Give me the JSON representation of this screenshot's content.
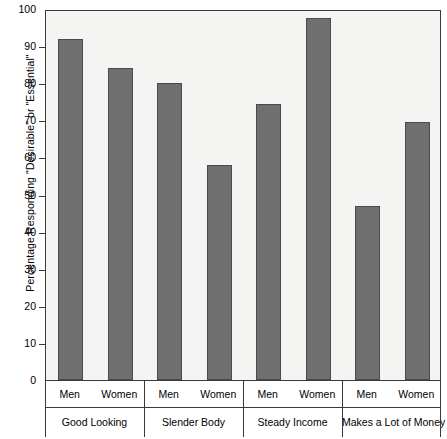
{
  "chart_data": {
    "type": "bar",
    "title": "",
    "subtitle": "",
    "xlabel": "",
    "ylabel": "Percentage Responding \"Desirable\" or \"Essential\"",
    "ylim": [
      0,
      100
    ],
    "ytick_step": 10,
    "yticks": [
      100,
      90,
      80,
      70,
      60,
      50,
      40,
      30,
      20,
      10,
      0
    ],
    "grid": false,
    "legend": "none",
    "bar_color": "#6f6f6f",
    "bar_border_color": "#4a4a4a",
    "plot_background": "#f4f4f2",
    "axis_color": "#3a3a3a",
    "groups": [
      "Good Looking",
      "Slender Body",
      "Steady Income",
      "Makes a Lot of Money"
    ],
    "categories": [
      "Men",
      "Women",
      "Men",
      "Women",
      "Men",
      "Women",
      "Men",
      "Women"
    ],
    "values": [
      92,
      84,
      80,
      58,
      74.5,
      97.5,
      47,
      69.5
    ],
    "series": [
      {
        "name": "Percentage Responding \"Desirable\" or \"Essential\"",
        "values": [
          92,
          84,
          80,
          58,
          74.5,
          97.5,
          47,
          69.5
        ]
      }
    ],
    "bars": [
      {
        "group": "Good Looking",
        "gender": "Men",
        "value": 92
      },
      {
        "group": "Good Looking",
        "gender": "Women",
        "value": 84
      },
      {
        "group": "Slender Body",
        "gender": "Men",
        "value": 80
      },
      {
        "group": "Slender Body",
        "gender": "Women",
        "value": 58
      },
      {
        "group": "Steady Income",
        "gender": "Men",
        "value": 74.5
      },
      {
        "group": "Steady Income",
        "gender": "Women",
        "value": 97.5
      },
      {
        "group": "Makes a Lot of Money",
        "gender": "Men",
        "value": 47
      },
      {
        "group": "Makes a Lot of Money",
        "gender": "Women",
        "value": 69.5
      }
    ]
  },
  "axis": {
    "y_title": "Percentage Responding \"Desirable\" or \"Essential\"",
    "ticks": [
      "100",
      "90",
      "80",
      "70",
      "60",
      "50",
      "40",
      "30",
      "20",
      "10",
      "0"
    ]
  },
  "bottom_labels": {
    "genders": [
      "Men",
      "Women",
      "Men",
      "Women",
      "Men",
      "Women",
      "Men",
      "Women"
    ],
    "groups": [
      "Good Looking",
      "Slender Body",
      "Steady Income",
      "Makes a Lot of Money"
    ]
  }
}
